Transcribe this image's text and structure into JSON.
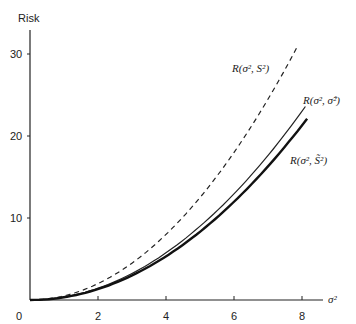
{
  "chart_data": {
    "type": "line",
    "title": "",
    "xlabel": "σ²",
    "ylabel": "Risk",
    "xlim": [
      0,
      8.6
    ],
    "ylim": [
      0,
      33
    ],
    "grid": false,
    "legend_position": "inline labels at right end of curves",
    "x_ticks": [
      0,
      2,
      4,
      6,
      8
    ],
    "y_ticks": [
      10,
      20,
      30
    ],
    "x_tick_labels": [
      "0",
      "2",
      "4",
      "6",
      "8"
    ],
    "y_tick_labels": [
      "10",
      "20",
      "30"
    ],
    "series": [
      {
        "name": "R(σ², S²)",
        "style": "dashed",
        "x": [
          0,
          1,
          2,
          3,
          4,
          5,
          6,
          7,
          7.85
        ],
        "values": [
          0,
          0.5,
          2.0,
          4.5,
          8.0,
          12.5,
          18.0,
          24.5,
          30.8
        ]
      },
      {
        "name": "R(σ², σ̂²)",
        "style": "solid-thin",
        "x": [
          0,
          1,
          2,
          3,
          4,
          5,
          6,
          7,
          8.1
        ],
        "values": [
          0,
          0.36,
          1.44,
          3.24,
          5.76,
          9.0,
          12.96,
          17.64,
          23.6
        ]
      },
      {
        "name": "R(σ², S̃²)",
        "style": "solid-thick",
        "x": [
          0,
          1,
          2,
          3,
          4,
          5,
          6,
          7,
          8.15
        ],
        "values": [
          0,
          0.33,
          1.33,
          3.0,
          5.33,
          8.33,
          12.0,
          16.33,
          22.1
        ]
      }
    ],
    "annotations": [
      {
        "text_main": "R(σ",
        "text_full": "R(σ², S²)",
        "series": 0
      },
      {
        "text_full": "R(σ², σ̂²)",
        "series": 1
      },
      {
        "text_full": "R(σ², S̃²)",
        "series": 2
      }
    ]
  },
  "labels": {
    "y_axis_title": "Risk",
    "x_axis_title": "σ²",
    "origin": "0",
    "series0": "R(σ², S²)",
    "series1": "R(σ², σ̂²)",
    "series2": "R(σ², S̃²)"
  }
}
